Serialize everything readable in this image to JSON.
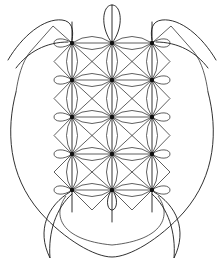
{
  "figure": {
    "colors": {
      "stroke": "#1a1a1a",
      "background": "#ffffff",
      "node": "#111111"
    },
    "grid": {
      "columns_x": [
        72,
        112,
        152
      ],
      "rows_y": [
        43,
        80,
        117,
        154,
        190
      ],
      "side_diamond_left_x": 54,
      "side_diamond_right_x": 170
    },
    "parts": {
      "head": {
        "label": "head-petal",
        "top_y": 5,
        "center_x": 112
      },
      "tail": {
        "label": "tail-petal",
        "bottom_y": 210,
        "line_end_y": 222
      },
      "shell": {
        "label": "shell-outline",
        "left_x": 11,
        "right_x": 212,
        "bottom_y": 257
      },
      "front_flippers": [
        "left-front-flipper",
        "right-front-flipper"
      ],
      "rear_flippers": [
        "left-rear-flipper",
        "right-rear-flipper"
      ],
      "plastron": {
        "label": "inner-u-curve",
        "bottom_y": 245
      }
    }
  }
}
